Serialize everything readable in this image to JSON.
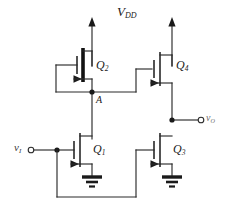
{
  "figure": {
    "type": "circuit-schematic"
  },
  "labels": {
    "supply": {
      "symbol": "V",
      "subscript": "DD",
      "text": "VDD"
    },
    "input": {
      "symbol": "v",
      "subscript": "I",
      "text": "vI"
    },
    "output": {
      "symbol": "v",
      "subscript": "O",
      "text": "vO"
    },
    "node_a": {
      "text": "A"
    },
    "q1": {
      "symbol": "Q",
      "subscript": "1",
      "text": "Q1"
    },
    "q2": {
      "symbol": "Q",
      "subscript": "2",
      "text": "Q2"
    },
    "q3": {
      "symbol": "Q",
      "subscript": "3",
      "text": "Q3"
    },
    "q4": {
      "symbol": "Q",
      "subscript": "4",
      "text": "Q4"
    }
  },
  "transistors": [
    {
      "id": "Q1",
      "label": "Q1",
      "channel": "NMOS",
      "gate_source": "vI",
      "drain_node": "A",
      "source_node": "ground",
      "gate_bar_weight": "thin"
    },
    {
      "id": "Q2",
      "label": "Q2",
      "channel": "PMOS",
      "gate_source": "A",
      "drain_node": "A",
      "source_node": "VDD",
      "gate_bar_weight": "thick",
      "note": "diode-connected"
    },
    {
      "id": "Q3",
      "label": "Q3",
      "channel": "NMOS",
      "gate_source": "vI",
      "drain_node": "vO",
      "source_node": "ground",
      "gate_bar_weight": "thin"
    },
    {
      "id": "Q4",
      "label": "Q4",
      "channel": "NMOS",
      "gate_source": "A",
      "drain_node": "VDD",
      "source_node": "vO",
      "gate_bar_weight": "thin"
    }
  ],
  "nodes": [
    {
      "id": "A",
      "label": "A",
      "type": "junction"
    },
    {
      "id": "vO",
      "label": "vO",
      "type": "output-terminal"
    },
    {
      "id": "vI",
      "label": "vI",
      "type": "input-terminal"
    },
    {
      "id": "gnd-left",
      "label": "",
      "type": "ground"
    },
    {
      "id": "gnd-right",
      "label": "",
      "type": "ground"
    }
  ],
  "colors": {
    "wire": "#2b2b2b",
    "device": "#1a1a1a",
    "background": "#ffffff",
    "label": "#1a1a1a",
    "label_muted": "#6e6e6e"
  }
}
